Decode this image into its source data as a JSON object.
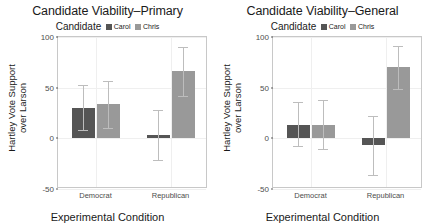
{
  "chart_data": {
    "type": "bar",
    "title": "Candidate Viability",
    "xlabel": "Experimental Condition",
    "ylabel_line1": "Hartley Vote Support",
    "ylabel_line2": "over Larson",
    "ylim": [
      -50,
      100
    ],
    "yticks": [
      100,
      50,
      0,
      -50
    ],
    "ytick_labels": [
      "100",
      "50",
      "0",
      "-50"
    ],
    "categories": [
      "Democrat",
      "Republican"
    ],
    "legend_title": "Candidate",
    "legend_position": "top",
    "grid": true,
    "colors": {
      "carol": "#555555",
      "chris": "#999999",
      "error_bar": "#bdbdbd",
      "panel_border": "#c8c8c8",
      "gridline": "#efefef"
    },
    "panels": [
      {
        "title": "Candidate Viability–Primary",
        "series": [
          {
            "name": "Carol",
            "color": "#555555",
            "values": [
              30,
              3
            ],
            "err_low": [
              8,
              -21
            ],
            "err_high": [
              53,
              28
            ]
          },
          {
            "name": "Chris",
            "color": "#999999",
            "values": [
              34,
              66
            ],
            "err_low": [
              10,
              42
            ],
            "err_high": [
              57,
              90
            ]
          }
        ]
      },
      {
        "title": "Candidate Viability–General",
        "series": [
          {
            "name": "Carol",
            "color": "#555555",
            "values": [
              13,
              -7
            ],
            "err_low": [
              -8,
              -36
            ],
            "err_high": [
              36,
              22
            ]
          },
          {
            "name": "Chris",
            "color": "#999999",
            "values": [
              13,
              70
            ],
            "err_low": [
              -11,
              49
            ],
            "err_high": [
              38,
              91
            ]
          }
        ]
      }
    ]
  }
}
